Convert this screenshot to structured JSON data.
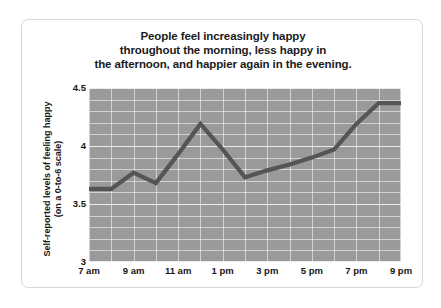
{
  "card": {
    "title_lines": [
      "People feel increasingly happy",
      "throughout the morning, less happy in",
      "the afternoon, and happier again in the evening."
    ]
  },
  "axis": {
    "y_title_lines": [
      "Self-reported levels of feeling happy",
      "(on a 0-to-6 scale)"
    ]
  },
  "chart_data": {
    "type": "line",
    "title": "People feel increasingly happy throughout the morning, less happy in the afternoon, and happier again in the evening.",
    "xlabel": "",
    "ylabel": "Self-reported levels of feeling happy (on a 0-to-6 scale)",
    "x": [
      "7 am",
      "8 am",
      "9 am",
      "10 am",
      "11 am",
      "12 pm",
      "1 pm",
      "2 pm",
      "3 pm",
      "4 pm",
      "5 pm",
      "6 pm",
      "7 pm",
      "8 pm",
      "9 pm"
    ],
    "values": [
      3.63,
      3.63,
      3.77,
      3.68,
      3.93,
      4.19,
      3.97,
      3.73,
      3.79,
      3.84,
      3.9,
      3.97,
      4.19,
      4.37,
      4.37
    ],
    "xtick_labels": [
      "7 am",
      "9 am",
      "11 am",
      "1 pm",
      "3 pm",
      "5 pm",
      "7 pm",
      "9 pm"
    ],
    "xtick_values": [
      "7 am",
      "9 am",
      "11 am",
      "1 pm",
      "3 pm",
      "5 pm",
      "7 pm",
      "9 pm"
    ],
    "ytick_labels": [
      "4.5",
      "4",
      "3.5",
      "3"
    ],
    "ytick_values": [
      4.5,
      4,
      3.5,
      3
    ],
    "ylim": [
      3,
      4.5
    ],
    "grid": true,
    "legend": "none",
    "line_color": "#555555",
    "plot_background": "#9a9a9a",
    "gridline_color": "#ffffff"
  }
}
